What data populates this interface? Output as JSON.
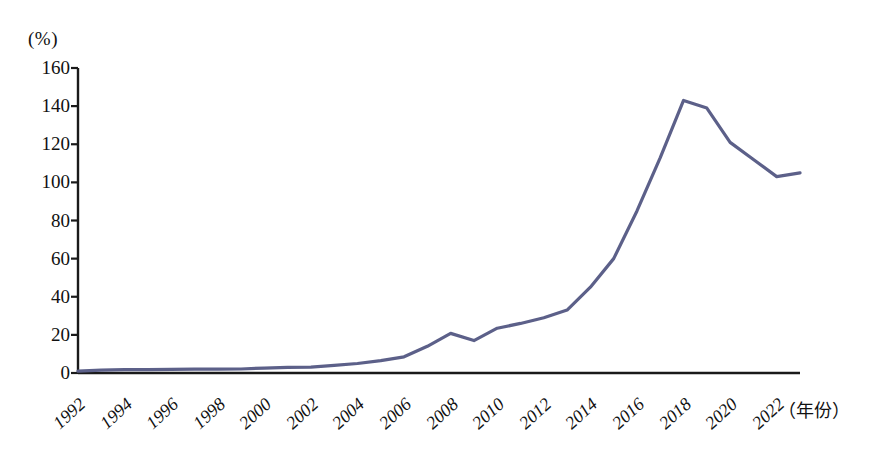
{
  "chart_data": {
    "type": "line",
    "title": "",
    "subtitle": "",
    "xlabel": "（年份）",
    "ylabel": "(%)",
    "unit_label": "(%)",
    "ylim": [
      0,
      160
    ],
    "xlim": [
      1992,
      2023
    ],
    "grid": false,
    "legend": "none",
    "line_color": "#5c6089",
    "axis_color": "#1a1a1a",
    "y_ticks": [
      0,
      20,
      40,
      60,
      80,
      100,
      120,
      140,
      160
    ],
    "x_tick_labels": [
      "1992",
      "1994",
      "1996",
      "1998",
      "2000",
      "2002",
      "2004",
      "2006",
      "2008",
      "2010",
      "2012",
      "2014",
      "2016",
      "2018",
      "2020",
      "2022"
    ],
    "x": [
      1992,
      1993,
      1994,
      1995,
      1996,
      1997,
      1998,
      1999,
      2000,
      2001,
      2002,
      2003,
      2004,
      2005,
      2006,
      2007,
      2008,
      2009,
      2010,
      2011,
      2012,
      2013,
      2014,
      2015,
      2016,
      2017,
      2018,
      2019,
      2020,
      2021,
      2022,
      2023
    ],
    "series": [
      {
        "name": "占比",
        "values": [
          1.0,
          1.5,
          1.8,
          1.8,
          1.9,
          2.0,
          2.0,
          2.1,
          2.6,
          3.0,
          3.1,
          4.0,
          5.0,
          6.5,
          8.5,
          14.0,
          20.8,
          17.0,
          23.5,
          26.0,
          29.0,
          33.0,
          45.0,
          60.0,
          85.0,
          113.0,
          143.0,
          139.0,
          121.0,
          112.0,
          103.0,
          105.0
        ]
      }
    ],
    "annotations": []
  }
}
